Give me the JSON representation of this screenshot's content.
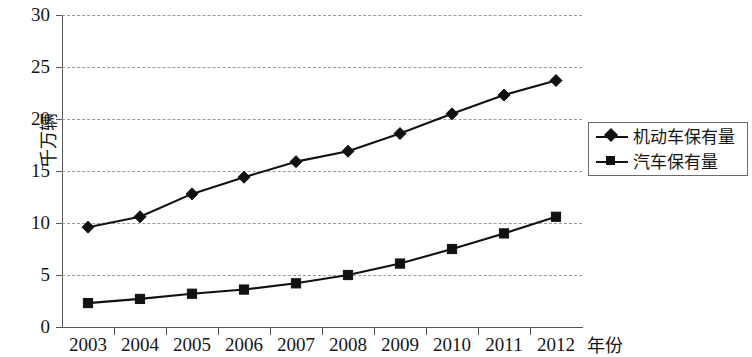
{
  "chart_data": {
    "type": "line",
    "title": "",
    "subtitle": "",
    "xlabel": "年份",
    "ylabel": "千万辆",
    "categories": [
      "2003",
      "2004",
      "2005",
      "2006",
      "2007",
      "2008",
      "2009",
      "2010",
      "2011",
      "2012"
    ],
    "series": [
      {
        "name": "机动车保有量",
        "marker": "diamond",
        "color": "#111111",
        "values": [
          9.6,
          10.6,
          12.8,
          14.4,
          15.9,
          16.9,
          18.6,
          20.5,
          22.3,
          23.7
        ]
      },
      {
        "name": "汽车保有量",
        "marker": "square",
        "color": "#111111",
        "values": [
          2.3,
          2.7,
          3.2,
          3.6,
          4.2,
          5.0,
          6.1,
          7.5,
          9.0,
          10.6
        ]
      }
    ],
    "ylim": [
      0,
      30
    ],
    "yticks": [
      0,
      5,
      10,
      15,
      20,
      25,
      30
    ],
    "ytick_labels": [
      "0",
      "5",
      "10",
      "15",
      "20",
      "25",
      "30"
    ],
    "grid": "horizontal-dashed",
    "legend_position": "right"
  },
  "legend": {
    "items": [
      {
        "label": "机动车保有量",
        "marker": "diamond"
      },
      {
        "label": "汽车保有量",
        "marker": "square"
      }
    ]
  },
  "axes": {
    "x_title": "年份",
    "y_title": "千万辆"
  }
}
